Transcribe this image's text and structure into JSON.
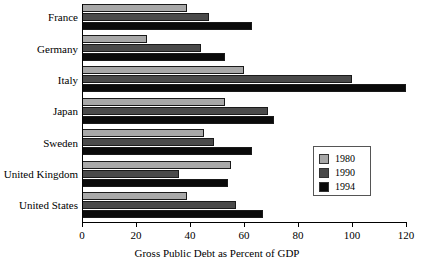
{
  "chart_data": {
    "type": "bar",
    "orientation": "horizontal",
    "title": "",
    "xlabel": "Gross Public Debt as Percent of GDP",
    "ylabel": "",
    "xlim": [
      0,
      120
    ],
    "xticks": [
      0,
      20,
      40,
      60,
      80,
      100,
      120
    ],
    "xtick_labels": [
      "0",
      "20",
      "40",
      "60",
      "80",
      "100",
      "120"
    ],
    "grid": false,
    "legend_position": "right-center",
    "categories": [
      "France",
      "Germany",
      "Italy",
      "Japan",
      "Sweden",
      "United Kingdom",
      "United States"
    ],
    "series": [
      {
        "name": "1980",
        "color": "#a8a8a8",
        "values": [
          39,
          24,
          60,
          53,
          45,
          55,
          39
        ]
      },
      {
        "name": "1990",
        "color": "#4a4a4a",
        "values": [
          47,
          44,
          100,
          69,
          49,
          36,
          57
        ]
      },
      {
        "name": "1994",
        "color": "#0a0a0a",
        "values": [
          63,
          53,
          120,
          71,
          63,
          54,
          67
        ]
      }
    ],
    "legend_entries": [
      {
        "label": "1980",
        "color": "#a8a8a8"
      },
      {
        "label": "1990",
        "color": "#4a4a4a"
      },
      {
        "label": "1994",
        "color": "#0a0a0a"
      }
    ]
  }
}
